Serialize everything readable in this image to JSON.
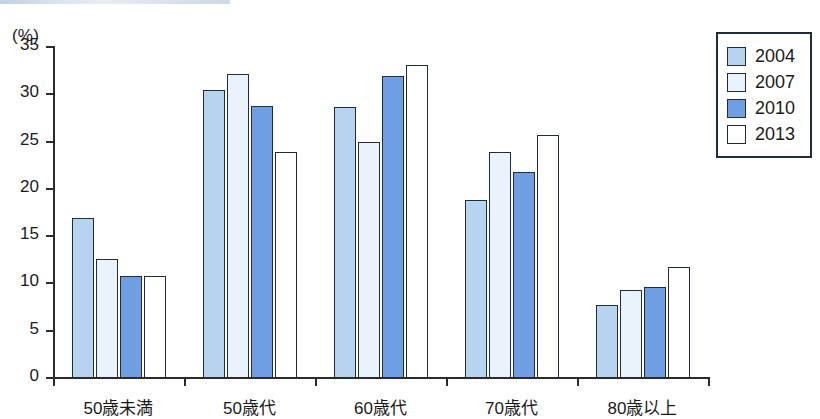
{
  "chart_data": {
    "type": "bar",
    "title": "",
    "subtitle": "",
    "xlabel": "",
    "ylabel": "(%)",
    "unit_label": "(%)",
    "categories": [
      "50歳未満",
      "50歳代",
      "60歳代",
      "70歳代",
      "80歳以上"
    ],
    "series": [
      {
        "name": "2004",
        "color": "#b6d3f0",
        "values": [
          16.8,
          30.3,
          28.5,
          18.7,
          7.6
        ]
      },
      {
        "name": "2007",
        "color": "#eaf3fb",
        "values": [
          12.5,
          32.0,
          24.8,
          23.8,
          9.2
        ]
      },
      {
        "name": "2010",
        "color": "#6f9fe2",
        "values": [
          10.7,
          28.7,
          31.8,
          21.7,
          9.5
        ]
      },
      {
        "name": "2013",
        "color": "#ffffff",
        "values": [
          10.7,
          23.8,
          33.0,
          25.6,
          11.6
        ]
      }
    ],
    "ylim": [
      0,
      35
    ],
    "ytick_values": [
      0,
      5,
      10,
      15,
      20,
      25,
      30,
      35
    ],
    "ytick_labels": [
      "0",
      "5",
      "10",
      "15",
      "20",
      "25",
      "30",
      "35"
    ],
    "grid": false,
    "legend_position": "top-right",
    "legend_entries": [
      "2004",
      "2007",
      "2010",
      "2013"
    ],
    "bar_outline_color": "#222b38",
    "axis_color": "#2b2b2b"
  }
}
